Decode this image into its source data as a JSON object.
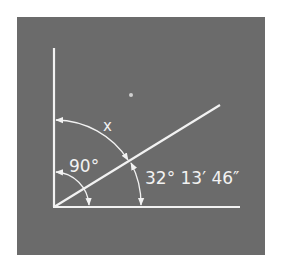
{
  "diagram": {
    "type": "angle-diagram",
    "colors": {
      "background": "#6b6b6b",
      "lines": "#f2f2f2",
      "page": "#ffffff"
    },
    "labels": {
      "unknown_angle": "x",
      "right_angle": "90°",
      "given_angle": "32° 13′ 46″"
    },
    "elements": [
      {
        "name": "vertical-axis",
        "desc": "vertical ray from origin upward"
      },
      {
        "name": "horizontal-axis",
        "desc": "horizontal ray from origin rightward"
      },
      {
        "name": "diagonal-ray",
        "desc": "ray at 32° 13′ 46″ above horizontal"
      },
      {
        "name": "arc-90",
        "desc": "small arc spanning vertical to horizontal, labeled 90°"
      },
      {
        "name": "arc-x",
        "desc": "large arc from vertical to diagonal, labeled x"
      },
      {
        "name": "arc-given",
        "desc": "large arc from diagonal to horizontal, labeled 32° 13′ 46″"
      }
    ]
  }
}
